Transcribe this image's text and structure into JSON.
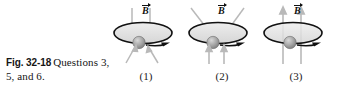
{
  "figure": {
    "label": "Fig. 32-18",
    "caption": "Questions 3, 5, and 6.",
    "panels": [
      {
        "number": "(1)",
        "field_label": "B",
        "field_vector_accent": "#111111",
        "description": "vertical field lines entering loop from above, splayed lines below"
      },
      {
        "number": "(2)",
        "field_label": "B",
        "field_vector_accent": "#111111",
        "description": "splayed field lines above loop, vertical arrows pointing up below"
      },
      {
        "number": "(3)",
        "field_label": "B",
        "field_vector_accent": "#111111",
        "description": "straight vertical field lines pointing upward through loop"
      }
    ],
    "colors": {
      "background": "#ffffff",
      "ink": "#111111",
      "loop_fill": "#e2e2e2",
      "loop_stroke": "#111111",
      "bead_fill": "#9a9a9a",
      "field_line": "#b4b4b4"
    }
  }
}
